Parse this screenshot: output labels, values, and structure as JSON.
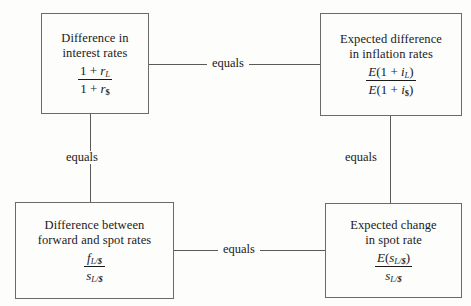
{
  "diagram": {
    "nodes": {
      "top_left": {
        "label": "Difference in\ninterest rates",
        "formula": {
          "numerator": "1 + r_L",
          "denominator": "1 + r_$",
          "num_parts": {
            "one": "1",
            "op": "+",
            "var": "r",
            "sub": "L"
          },
          "den_parts": {
            "one": "1",
            "op": "+",
            "var": "r",
            "sub": "$"
          }
        }
      },
      "top_right": {
        "label": "Expected difference\nin inflation rates",
        "formula": {
          "numerator": "E(1 + i_L)",
          "denominator": "E(1 + i_$)",
          "num_parts": {
            "fn": "E",
            "open": "(1",
            "op": "+",
            "var": "i",
            "sub": "L",
            "close": ")"
          },
          "den_parts": {
            "fn": "E",
            "open": "(1",
            "op": "+",
            "var": "i",
            "sub": "$",
            "close": ")"
          }
        }
      },
      "bottom_left": {
        "label": "Difference between\nforward and spot rates",
        "formula": {
          "numerator": "f_L/$",
          "denominator": "s_L/$",
          "num_parts": {
            "var": "f",
            "sub": "L/$"
          },
          "den_parts": {
            "var": "s",
            "sub": "L/$"
          }
        }
      },
      "bottom_right": {
        "label": "Expected change\nin spot rate",
        "formula": {
          "numerator": "E(s_L/$)",
          "denominator": "s_L/$",
          "num_parts": {
            "fn": "E",
            "open": "(",
            "var": "s",
            "sub": "L/$",
            "close": ")"
          },
          "den_parts": {
            "var": "s",
            "sub": "L/$"
          }
        }
      }
    },
    "edges": [
      {
        "id": "top",
        "from": "top_left",
        "to": "top_right",
        "label": "equals",
        "orientation": "horizontal"
      },
      {
        "id": "left",
        "from": "top_left",
        "to": "bottom_left",
        "label": "equals",
        "orientation": "vertical"
      },
      {
        "id": "right",
        "from": "top_right",
        "to": "bottom_right",
        "label": "equals",
        "orientation": "vertical"
      },
      {
        "id": "bottom",
        "from": "bottom_left",
        "to": "bottom_right",
        "label": "equals",
        "orientation": "horizontal"
      }
    ],
    "colors": {
      "background": "#fdfdfc",
      "box_border": "#6b6b6b",
      "connector": "#5a5a5a",
      "text": "#1a1a1a"
    }
  }
}
